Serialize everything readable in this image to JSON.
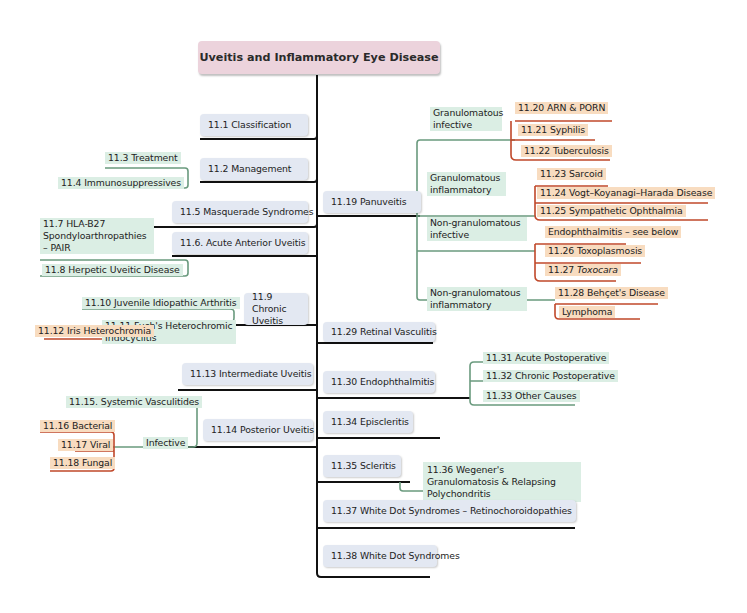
{
  "title": "Uveitis and Inflammatory Eye Disease",
  "left_branches": [
    {
      "label": "11.1 Classification"
    },
    {
      "label": "11.2 Management",
      "children": [
        "11.3 Treatment",
        "11.4 Immunosuppressives"
      ]
    },
    {
      "label": "11.5 Masquerade Syndromes"
    },
    {
      "label": "11.6. Acute Anterior Uveitis",
      "children": [
        "11.7 HLA-B27 Spondyloarthropathies – PAIR",
        "11.8 Herpetic Uveitic Disease"
      ]
    },
    {
      "label": "11.9 Chronic Uveitis",
      "children": [
        "11.10 Juvenile Idiopathic Arthritis",
        "11.11  Fuch's Heterochromic Iridocyclitis"
      ],
      "grandchildren": [
        "11.12 Iris Heterochromia"
      ]
    },
    {
      "label": "11.13 Intermediate Uveitis"
    },
    {
      "label": "11.14 Posterior Uveitis",
      "children": [
        "11.15. Systemic Vasculitides",
        "Infective"
      ],
      "grandchildren": [
        "11.16 Bacterial",
        "11.17 Viral",
        "11.18 Fungal"
      ]
    }
  ],
  "right_branches": [
    {
      "label": "11.19 Panuveitis",
      "groups": [
        {
          "label": "Granulomatous infective",
          "items": [
            "11.20 ARN & PORN",
            "11.21 Syphilis",
            "11.22 Tuberculosis"
          ]
        },
        {
          "label": "Granulomatous inflammatory",
          "items": [
            "11.23 Sarcoid",
            "11.24 Vogt–Koyanagi–Harada Disease",
            "11.25 Sympathetic Ophthalmia"
          ]
        },
        {
          "label": "Non-granulomatous infective",
          "items": [
            "Endophthalmitis – see below",
            "11.26 Toxoplasmosis",
            "11.27",
            "Toxocara"
          ]
        },
        {
          "label": "Non-granulomatous inflammatory",
          "items": [
            "11.28 Behçet's Disease",
            "Lymphoma"
          ]
        }
      ]
    },
    {
      "label": "11.29 Retinal Vasculitis"
    },
    {
      "label": "11.30 Endophthalmitis",
      "children": [
        "11.31 Acute Postoperative",
        "11.32 Chronic Postoperative",
        "11.33 Other Causes"
      ]
    },
    {
      "label": "11.34 Episcleritis"
    },
    {
      "label": "11.35 Scleritis",
      "children": [
        "11.36 Wegener's Granulomatosis & Relapsing Polychondritis"
      ]
    },
    {
      "label": "11.37 White Dot Syndromes – Retinochoroidopathies"
    },
    {
      "label": "11.38 White Dot Syndromes"
    }
  ],
  "colors": {
    "root": "#ecd3dc",
    "branch": "#e3e8f2",
    "green": "#dbeee4",
    "orange": "#f8dcc0",
    "green_line": "#6a9a7e",
    "orange_line": "#c0482a",
    "black_line": "#111111"
  }
}
